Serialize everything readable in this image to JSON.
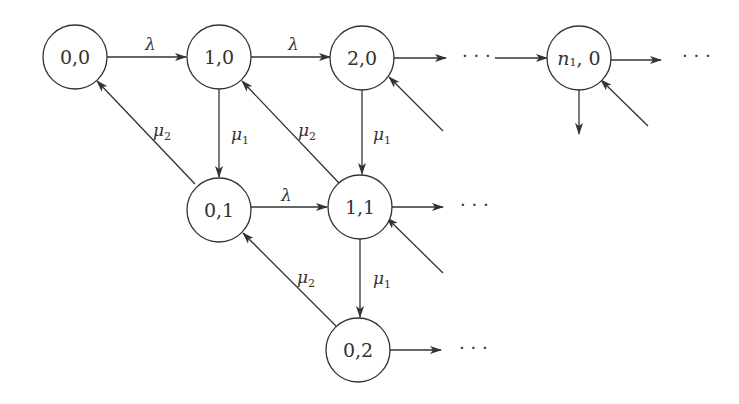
{
  "diagram": {
    "type": "state-transition",
    "nodes": [
      {
        "id": "n00",
        "label": "0,0",
        "x": 75,
        "y": 57
      },
      {
        "id": "n10",
        "label": "1,0",
        "x": 219,
        "y": 57
      },
      {
        "id": "n20",
        "label": "2,0",
        "x": 362,
        "y": 58
      },
      {
        "id": "nn10",
        "label": "n",
        "sub": "1",
        "suffix": ", 0",
        "x": 579,
        "y": 58
      },
      {
        "id": "n01",
        "label": "0,1",
        "x": 219,
        "y": 210
      },
      {
        "id": "n11",
        "label": "1,1",
        "x": 360,
        "y": 207
      },
      {
        "id": "n02",
        "label": "0,2",
        "x": 358,
        "y": 350
      }
    ],
    "edge_labels": {
      "lambda": "λ",
      "mu": "μ",
      "sub1": "1",
      "sub2": "2"
    },
    "ellipsis": "· · ·",
    "edges": [
      {
        "from": "0,0",
        "to": "1,0",
        "rate": "λ"
      },
      {
        "from": "1,0",
        "to": "2,0",
        "rate": "λ"
      },
      {
        "from": "2,0",
        "to": "…",
        "rate": ""
      },
      {
        "from": "…",
        "to": "n1,0",
        "rate": ""
      },
      {
        "from": "n1,0",
        "to": "…",
        "rate": ""
      },
      {
        "from": "1,0",
        "to": "0,1",
        "rate": "μ1"
      },
      {
        "from": "2,0",
        "to": "1,1",
        "rate": "μ1"
      },
      {
        "from": "0,1",
        "to": "0,0",
        "rate": "μ2"
      },
      {
        "from": "1,1",
        "to": "1,0",
        "rate": "μ2"
      },
      {
        "from": "0,1",
        "to": "1,1",
        "rate": "λ"
      },
      {
        "from": "1,1",
        "to": "0,2",
        "rate": "μ1"
      },
      {
        "from": "0,2",
        "to": "0,1",
        "rate": "μ2"
      },
      {
        "from": "1,1",
        "to": "…",
        "rate": ""
      },
      {
        "from": "0,2",
        "to": "…",
        "rate": ""
      }
    ]
  }
}
